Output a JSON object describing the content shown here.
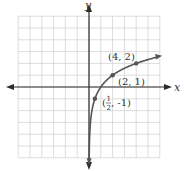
{
  "chart_data": {
    "type": "line",
    "title": "",
    "xlabel": "x",
    "ylabel": "y",
    "xlim": [
      -6,
      6
    ],
    "ylim": [
      -6,
      6
    ],
    "grid": true,
    "legend": "none",
    "function": "y = log2(x)",
    "series": [
      {
        "name": "log2(x)",
        "x": [
          0.03125,
          0.0625,
          0.125,
          0.25,
          0.5,
          1,
          2,
          4,
          5.6
        ],
        "values": [
          -5,
          -4,
          -3,
          -2,
          -1,
          0,
          1,
          2,
          2.49
        ]
      }
    ],
    "points": [
      {
        "x": 0.5,
        "y": -1,
        "label": "(1/2, -1)"
      },
      {
        "x": 2,
        "y": 1,
        "label": "(2, 1)"
      },
      {
        "x": 4,
        "y": 2,
        "label": "(4, 2)"
      }
    ],
    "annotations": [
      {
        "text": "(4, 2)",
        "near": [
          4,
          2
        ]
      },
      {
        "text": "(2, 1)",
        "near": [
          2,
          1
        ]
      },
      {
        "text": "(1/2, -1)",
        "near": [
          0.5,
          -1
        ]
      }
    ]
  },
  "labels": {
    "x_axis": "x",
    "y_axis": "y",
    "point_a": "(4, 2)",
    "point_b": "(2, 1)",
    "point_c_open": "(",
    "point_c_num": "1",
    "point_c_den": "2",
    "point_c_rest": ", -1)"
  },
  "colors": {
    "grid": "#cfcfcf",
    "axis": "#2b2b2b",
    "curve": "#555555",
    "point": "#555555"
  }
}
